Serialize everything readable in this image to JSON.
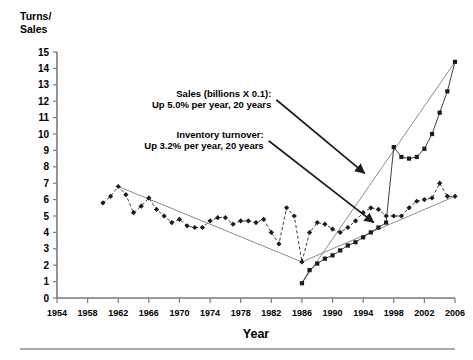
{
  "chart_data": {
    "type": "line",
    "title": "",
    "xlabel": "Year",
    "ylabel": "Turns/\nSales",
    "ylabel_line1": "Turns/",
    "ylabel_line2": "Sales",
    "xlim": [
      1954,
      2006
    ],
    "ylim": [
      0,
      15
    ],
    "yticks": [
      0,
      1,
      2,
      3,
      4,
      5,
      6,
      7,
      8,
      9,
      10,
      11,
      12,
      13,
      14,
      15
    ],
    "xticks": [
      1954,
      1958,
      1962,
      1966,
      1970,
      1974,
      1978,
      1982,
      1986,
      1990,
      1994,
      1998,
      2002,
      2006
    ],
    "grid": false,
    "legend": "none",
    "series": [
      {
        "name": "Inventory turnover",
        "style": "dashed",
        "marker": "diamond",
        "x": [
          1960,
          1961,
          1962,
          1963,
          1964,
          1965,
          1966,
          1967,
          1968,
          1969,
          1970,
          1971,
          1972,
          1973,
          1974,
          1975,
          1976,
          1977,
          1978,
          1979,
          1980,
          1981,
          1982,
          1983,
          1984,
          1985,
          1986,
          1987,
          1988,
          1989,
          1990,
          1991,
          1992,
          1993,
          1994,
          1995,
          1996,
          1997,
          1998,
          1999,
          2000,
          2001,
          2002,
          2003,
          2004,
          2005,
          2006
        ],
        "values": [
          5.8,
          6.2,
          6.8,
          6.3,
          5.2,
          5.6,
          6.1,
          5.4,
          5.0,
          4.6,
          4.8,
          4.4,
          4.3,
          4.3,
          4.7,
          4.9,
          4.9,
          4.5,
          4.7,
          4.7,
          4.6,
          4.8,
          4.0,
          3.3,
          5.5,
          5.0,
          2.2,
          4.0,
          4.6,
          4.5,
          4.2,
          4.0,
          4.3,
          4.7,
          5.2,
          5.5,
          5.4,
          5.0,
          5.0,
          5.0,
          5.5,
          5.9,
          6.0,
          6.1,
          7.0,
          6.2,
          6.2
        ]
      },
      {
        "name": "Sales (billions X 0.1)",
        "style": "solid",
        "marker": "square",
        "x": [
          1986,
          1987,
          1988,
          1989,
          1990,
          1991,
          1992,
          1993,
          1994,
          1995,
          1996,
          1997,
          1998,
          1999,
          2000,
          2001,
          2002,
          2003,
          2004,
          2005,
          2006
        ],
        "values": [
          0.9,
          1.7,
          2.1,
          2.4,
          2.6,
          2.9,
          3.2,
          3.4,
          3.7,
          4.0,
          4.3,
          4.6,
          9.2,
          8.6,
          8.5,
          8.6,
          9.1,
          10.0,
          11.3,
          12.6,
          14.4
        ]
      }
    ],
    "trendlines": [
      {
        "name": "turnover-trend-down",
        "x": [
          1962,
          1986
        ],
        "values": [
          6.8,
          2.2
        ]
      },
      {
        "name": "turnover-trend-up",
        "x": [
          1986,
          2006
        ],
        "values": [
          2.2,
          6.2
        ]
      },
      {
        "name": "sales-trend-up",
        "x": [
          1986,
          2006
        ],
        "values": [
          0.9,
          14.4
        ]
      }
    ],
    "annotations": [
      {
        "name": "sales-annotation",
        "line1": "Sales (billions X 0.1):",
        "line2": "Up 5.0% per year, 20 years",
        "arrow_from": [
          1982.0,
          11.6
        ],
        "arrow_to": [
          1994.2,
          7.6
        ]
      },
      {
        "name": "turnover-annotation",
        "line1": "Inventory turnover:",
        "line2": "Up 3.2% per year, 20 years",
        "arrow_from": [
          1981.0,
          9.1
        ],
        "arrow_to": [
          1995.4,
          4.6
        ]
      }
    ]
  }
}
